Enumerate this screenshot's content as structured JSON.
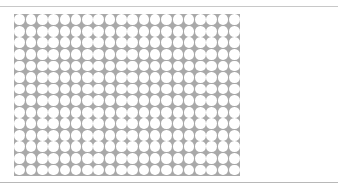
{
  "header": {
    "caption": ""
  },
  "grid": {
    "columns": 20,
    "rows": 14,
    "cell_width": 11.3,
    "cell_height": 11.55,
    "background_color": "#a9a9a9",
    "circle_color": "#ffffff"
  }
}
